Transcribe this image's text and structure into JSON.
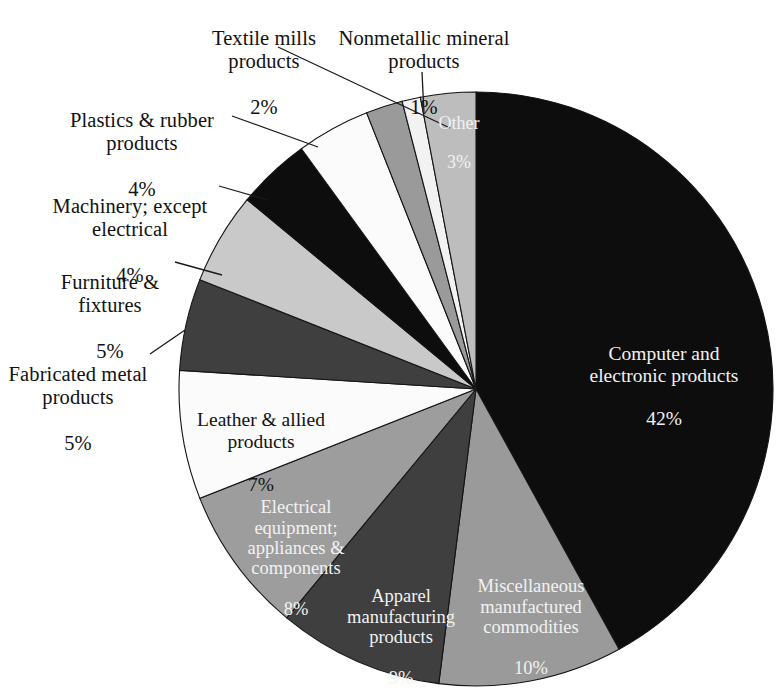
{
  "chart_data": {
    "type": "pie",
    "title": "",
    "subtitle": "",
    "xlabel": "",
    "ylabel": "",
    "legend_position": "none",
    "grid": false,
    "units": "percent",
    "total": 100,
    "start_angle_deg": 0,
    "direction": "clockwise",
    "categories": [
      "Computer and electronic products",
      "Miscellaneous manufactured commodities",
      "Apparel manufacturing products",
      "Electrical equipment; appliances & components",
      "Leather & allied products",
      "Fabricated metal products",
      "Furniture & fixtures",
      "Machinery; except electrical",
      "Plastics & rubber products",
      "Textile mills products",
      "Nonmetallic mineral products",
      "Other"
    ],
    "values": [
      42,
      10,
      9,
      8,
      7,
      5,
      5,
      4,
      4,
      2,
      1,
      3
    ],
    "slices": [
      {
        "id": "computer-and-electronic-products",
        "name": "Computer and electronic products",
        "name_lines": [
          "Computer and",
          "electronic products"
        ],
        "value": 42,
        "percent_label": "42%",
        "fill": "#0d0d0d",
        "label_placement": "inside",
        "text_color": "#f2f2f2"
      },
      {
        "id": "miscellaneous-manufactured-commodities",
        "name": "Miscellaneous manufactured commodities",
        "name_lines": [
          "Miscellaneous",
          "manufactured",
          "commodities"
        ],
        "value": 10,
        "percent_label": "10%",
        "fill": "#9a9a9a",
        "label_placement": "inside",
        "text_color": "#f7f7f7"
      },
      {
        "id": "apparel-manufacturing-products",
        "name": "Apparel manufacturing products",
        "name_lines": [
          "Apparel",
          "manufacturing",
          "products"
        ],
        "value": 9,
        "percent_label": "9%",
        "fill": "#3f3f3f",
        "label_placement": "inside",
        "text_color": "#f2f2f2"
      },
      {
        "id": "electrical-equipment-appliances-components",
        "name": "Electrical equipment; appliances & components",
        "name_lines": [
          "Electrical",
          "equipment;",
          "appliances &",
          "components"
        ],
        "value": 8,
        "percent_label": "8%",
        "fill": "#9d9d9d",
        "label_placement": "inside",
        "text_color": "#f7f7f7"
      },
      {
        "id": "leather-and-allied-products",
        "name": "Leather & allied products",
        "name_lines": [
          "Leather & allied",
          "products"
        ],
        "value": 7,
        "percent_label": "7%",
        "fill": "#fbfbfb",
        "label_placement": "inside",
        "text_color": "#111111"
      },
      {
        "id": "fabricated-metal-products",
        "name": "Fabricated metal products",
        "name_lines": [
          "Fabricated metal",
          "products"
        ],
        "value": 5,
        "percent_label": "5%",
        "fill": "#3f3f3f",
        "label_placement": "outside",
        "text_color": "#111111"
      },
      {
        "id": "furniture-and-fixtures",
        "name": "Furniture & fixtures",
        "name_lines": [
          "Furniture &",
          "fixtures"
        ],
        "value": 5,
        "percent_label": "5%",
        "fill": "#c9c9c9",
        "label_placement": "outside",
        "text_color": "#111111"
      },
      {
        "id": "machinery-except-electrical",
        "name": "Machinery; except electrical",
        "name_lines": [
          "Machinery; except",
          "electrical"
        ],
        "value": 4,
        "percent_label": "4%",
        "fill": "#0d0d0d",
        "label_placement": "outside",
        "text_color": "#111111"
      },
      {
        "id": "plastics-and-rubber-products",
        "name": "Plastics & rubber products",
        "name_lines": [
          "Plastics & rubber",
          "products"
        ],
        "value": 4,
        "percent_label": "4%",
        "fill": "#fbfbfb",
        "label_placement": "outside",
        "text_color": "#111111"
      },
      {
        "id": "textile-mills-products",
        "name": "Textile mills products",
        "name_lines": [
          "Textile mills",
          "products"
        ],
        "value": 2,
        "percent_label": "2%",
        "fill": "#9a9a9a",
        "label_placement": "outside",
        "text_color": "#111111"
      },
      {
        "id": "nonmetallic-mineral-products",
        "name": "Nonmetallic mineral products",
        "name_lines": [
          "Nonmetallic mineral",
          "products"
        ],
        "value": 1,
        "percent_label": "1%",
        "fill": "#f2f2f2",
        "label_placement": "outside",
        "text_color": "#111111"
      },
      {
        "id": "other",
        "name": "Other",
        "name_lines": [
          "Other"
        ],
        "value": 3,
        "percent_label": "3%",
        "fill": "#bdbdbd",
        "label_placement": "inside",
        "text_color": "#ffffff"
      }
    ]
  },
  "labels": {
    "textile_mills": {
      "name": "Textile mills\nproducts",
      "pct": "2%"
    },
    "nonmetallic": {
      "name": "Nonmetallic mineral\nproducts",
      "pct": "1%"
    },
    "plastics": {
      "name": "Plastics & rubber\nproducts",
      "pct": "4%"
    },
    "machinery": {
      "name": "Machinery; except\nelectrical",
      "pct": "4%"
    },
    "furniture": {
      "name": "Furniture &\nfixtures",
      "pct": "5%"
    },
    "fabricated": {
      "name": "Fabricated metal\nproducts",
      "pct": "5%"
    },
    "other": {
      "name": "Other",
      "pct": "3%"
    },
    "computer": {
      "name": "Computer and\nelectronic products",
      "pct": "42%"
    },
    "miscellaneous": {
      "name": "Miscellaneous\nmanufactured\ncommodities",
      "pct": "10%"
    },
    "apparel": {
      "name": "Apparel\nmanufacturing\nproducts",
      "pct": "9%"
    },
    "electrical": {
      "name": "Electrical\nequipment;\nappliances &\ncomponents",
      "pct": "8%"
    },
    "leather": {
      "name": "Leather & allied\nproducts",
      "pct": "7%"
    }
  },
  "geometry": {
    "center_x": 476,
    "center_y": 389,
    "radius": 297
  }
}
